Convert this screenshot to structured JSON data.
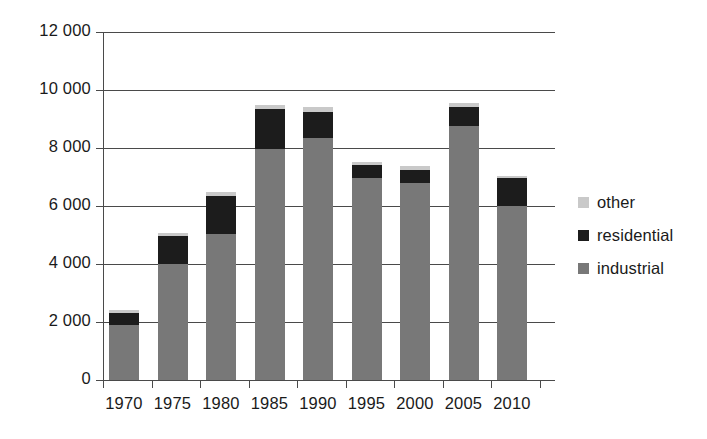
{
  "chart_data": {
    "type": "bar",
    "subtype": "stacked-vertical",
    "title": "",
    "subtitle": "",
    "xlabel": "",
    "ylabel": "",
    "categories": [
      "1970",
      "1975",
      "1980",
      "1985",
      "1990",
      "1995",
      "2000",
      "2005",
      "2010"
    ],
    "series": [
      {
        "name": "industrial",
        "color": "#787878",
        "values": [
          1900,
          4000,
          5050,
          7950,
          8350,
          6950,
          6800,
          8750,
          6000
        ]
      },
      {
        "name": "residential",
        "color": "#1c1c1c",
        "values": [
          400,
          950,
          1300,
          1400,
          900,
          450,
          450,
          650,
          950
        ]
      },
      {
        "name": "other",
        "color": "#c9c9c9",
        "values": [
          100,
          120,
          150,
          150,
          150,
          130,
          130,
          150,
          100
        ]
      }
    ],
    "totals": [
      2400,
      5070,
      6500,
      9500,
      9400,
      7530,
      7380,
      9550,
      7050
    ],
    "ylim": [
      0,
      12000
    ],
    "ytick_values": [
      0,
      2000,
      4000,
      6000,
      8000,
      10000,
      12000
    ],
    "ytick_labels": [
      "0",
      "2 000",
      "4 000",
      "6 000",
      "8 000",
      "10 000",
      "12 000"
    ],
    "grid": "horizontal",
    "legend_position": "right",
    "stack_order_bottom_to_top": [
      "industrial",
      "residential",
      "other"
    ]
  },
  "legend": {
    "items": [
      {
        "label": "other",
        "color": "#c9c9c9"
      },
      {
        "label": "residential",
        "color": "#1c1c1c"
      },
      {
        "label": "industrial",
        "color": "#787878"
      }
    ]
  }
}
